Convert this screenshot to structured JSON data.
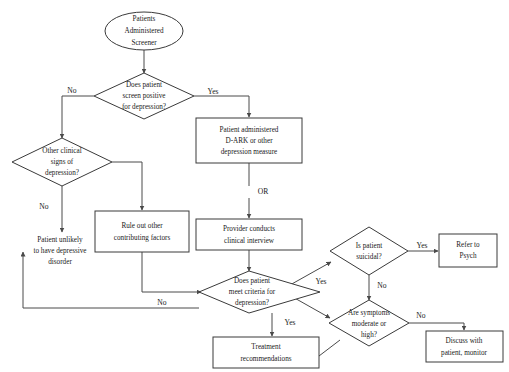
{
  "diagram": {
    "background_color": "#ffffff",
    "stroke_color": "#3a3a3a",
    "text_color": "#1a1a1a",
    "nodes": [
      {
        "id": "start",
        "shape": "ellipse",
        "lines": [
          "Patients",
          "Administered",
          "Screener"
        ]
      },
      {
        "id": "screen_pos",
        "shape": "diamond",
        "lines": [
          "Does patient",
          "screen positive",
          "for depression?"
        ]
      },
      {
        "id": "other_signs",
        "shape": "diamond",
        "lines": [
          "Other clinical",
          "signs of",
          "depression?"
        ]
      },
      {
        "id": "unlikely",
        "shape": "text",
        "lines": [
          "Patient unlikely",
          "to have depressive",
          "disorder"
        ]
      },
      {
        "id": "rule_out",
        "shape": "rect",
        "lines": [
          "Rule out other",
          "contributing factors"
        ]
      },
      {
        "id": "dark",
        "shape": "rect",
        "lines": [
          "Patient administered",
          "D-ARK or other",
          "depression measure"
        ]
      },
      {
        "id": "interview",
        "shape": "rect",
        "lines": [
          "Provider conducts",
          "clinical interview"
        ]
      },
      {
        "id": "meet_crit",
        "shape": "diamond",
        "lines": [
          "Does patient",
          "meet criteria for",
          "depression?"
        ]
      },
      {
        "id": "suicidal",
        "shape": "diamond",
        "lines": [
          "Is patient",
          "suicidal?"
        ]
      },
      {
        "id": "refer",
        "shape": "rect",
        "lines": [
          "Refer to",
          "Psych"
        ]
      },
      {
        "id": "severity",
        "shape": "diamond",
        "lines": [
          "Are symptoms",
          "moderate or",
          "high?"
        ]
      },
      {
        "id": "discuss",
        "shape": "rect",
        "lines": [
          "Discuss with",
          "patient, monitor"
        ]
      },
      {
        "id": "treatment",
        "shape": "rect",
        "lines": [
          "Treatment",
          "recommendations"
        ]
      }
    ],
    "connector_labels": {
      "screen_yes": "Yes",
      "screen_no": "No",
      "signs_no": "No",
      "meet_no": "No",
      "meet_yes_up": "Yes",
      "meet_yes_down": "Yes",
      "suicidal_yes": "Yes",
      "suicidal_no": "No",
      "severity_no": "No"
    },
    "or_connector": "OR"
  }
}
